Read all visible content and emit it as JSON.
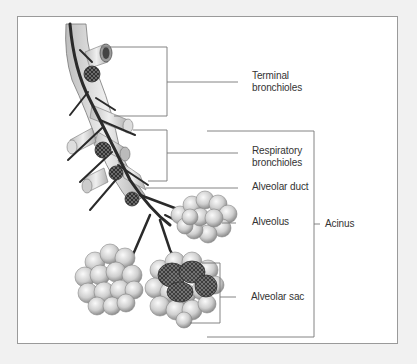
{
  "diagram": {
    "labels": {
      "terminal_bronchioles": [
        "Terminal",
        "bronchioles"
      ],
      "respiratory_bronchioles": [
        "Respiratory",
        "bronchioles"
      ],
      "alveolar_duct": "Alveolar duct",
      "alveolus": "Alveolus",
      "acinus": "Acinus",
      "alveolar_sac": "Alveolar sac"
    },
    "colors": {
      "background": "#f1f1f1",
      "frame_fill": "#ffffff",
      "frame_border": "#9a9a9a",
      "leader_line": "#777777",
      "text": "#333333",
      "tissue_light": "#e4e4e4",
      "tissue_mid": "#b8b8b8",
      "vessel_dark": "#2a2a2a"
    }
  }
}
